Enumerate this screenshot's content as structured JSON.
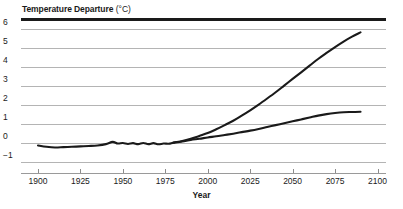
{
  "chart_data": {
    "type": "line",
    "title": "Temperature Departure (°C)",
    "title_bold_part": "Temperature Departure",
    "title_unit_part": "(°C)",
    "xlabel": "Year",
    "ylabel": "Temperature Departure (°C)",
    "xlim": [
      1890,
      2105
    ],
    "ylim": [
      -1.6,
      6.4
    ],
    "grid": true,
    "legend": "none",
    "x_ticks": [
      "1900",
      "1925",
      "1950",
      "1975",
      "2000",
      "2025",
      "2050",
      "2075",
      "2100"
    ],
    "x_tick_values": [
      1900,
      1925,
      1950,
      1975,
      2000,
      2025,
      2050,
      2075,
      2100
    ],
    "y_ticks": [
      "6",
      "5",
      "4",
      "3",
      "2",
      "1",
      "0",
      "−1"
    ],
    "y_tick_values": [
      6,
      5,
      4,
      3,
      2,
      1,
      0,
      -1
    ],
    "line_color": "#1a1a1a",
    "grid_color": "#b4b4b4",
    "series": [
      {
        "name": "observed-and-high-projection",
        "x": [
          1900,
          1905,
          1910,
          1915,
          1920,
          1925,
          1930,
          1935,
          1940,
          1944,
          1947,
          1950,
          1953,
          1956,
          1959,
          1962,
          1965,
          1968,
          1971,
          1974,
          1977,
          1980,
          1985,
          1990,
          1995,
          2000,
          2005,
          2010,
          2015,
          2020,
          2025,
          2030,
          2035,
          2040,
          2045,
          2050,
          2055,
          2060,
          2065,
          2070,
          2075,
          2080,
          2085,
          2090
        ],
        "values": [
          -0.15,
          -0.22,
          -0.26,
          -0.24,
          -0.22,
          -0.2,
          -0.18,
          -0.15,
          -0.08,
          0.04,
          -0.05,
          -0.02,
          -0.07,
          -0.03,
          -0.08,
          -0.02,
          -0.08,
          -0.03,
          -0.09,
          -0.05,
          -0.06,
          0.0,
          0.08,
          0.2,
          0.35,
          0.5,
          0.7,
          0.92,
          1.15,
          1.42,
          1.7,
          2.0,
          2.32,
          2.65,
          3.0,
          3.35,
          3.7,
          4.05,
          4.4,
          4.72,
          5.03,
          5.32,
          5.58,
          5.8
        ]
      },
      {
        "name": "low-projection",
        "x": [
          1980,
          1985,
          1990,
          1995,
          2000,
          2005,
          2010,
          2015,
          2020,
          2025,
          2030,
          2035,
          2040,
          2045,
          2050,
          2055,
          2060,
          2065,
          2070,
          2075,
          2080,
          2085,
          2090
        ],
        "values": [
          0.0,
          0.06,
          0.14,
          0.2,
          0.27,
          0.33,
          0.4,
          0.47,
          0.55,
          0.63,
          0.72,
          0.82,
          0.92,
          1.02,
          1.12,
          1.22,
          1.32,
          1.42,
          1.5,
          1.56,
          1.6,
          1.61,
          1.62
        ]
      }
    ]
  }
}
